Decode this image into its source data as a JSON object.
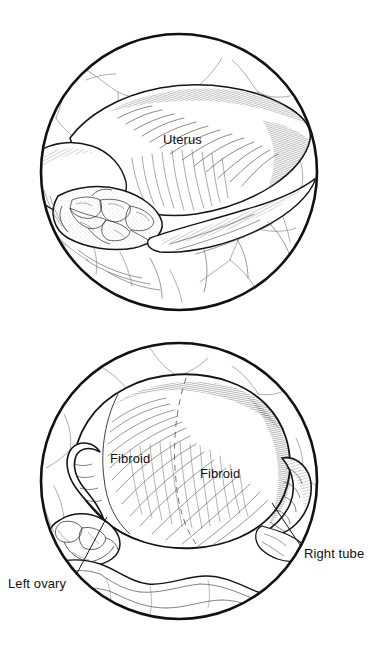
{
  "illustration": {
    "style": "pen-and-ink laparoscopic medical illustration",
    "background_color": "#ffffff",
    "ink_color": "#111111",
    "panels": [
      {
        "id": "uterus-panel",
        "name": "laparoscopic-view-uterus",
        "shape": "circle",
        "center": [
          179,
          172
        ],
        "radius": 139,
        "labels": [
          {
            "id": "uterus",
            "text": "Uterus",
            "x": 163,
            "y": 133,
            "leader": false
          }
        ]
      },
      {
        "id": "fibroids-panel",
        "name": "laparoscopic-view-fibroid-uterus",
        "shape": "circle",
        "center": [
          179,
          151
        ],
        "radius": 139,
        "labels": [
          {
            "id": "fibroid-left",
            "text": "Fibroid",
            "x": 110,
            "y": 122,
            "leader": false
          },
          {
            "id": "fibroid-right",
            "text": "Fibroid",
            "x": 200,
            "y": 137,
            "leader": false
          },
          {
            "id": "left-ovary",
            "text": "Left ovary",
            "x": 8,
            "y": 247,
            "leader": true,
            "leader_from": [
              76,
              245
            ],
            "leader_to": [
              107,
              187
            ]
          },
          {
            "id": "right-tube",
            "text": "Right tube",
            "x": 304,
            "y": 217,
            "leader": true,
            "leader_from": [
              300,
              215
            ],
            "leader_to": [
              272,
              173
            ]
          }
        ]
      }
    ]
  },
  "labels": {
    "uterus": "Uterus",
    "fibroid_left": "Fibroid",
    "fibroid_right": "Fibroid",
    "left_ovary": "Left ovary",
    "right_tube": "Right tube"
  }
}
